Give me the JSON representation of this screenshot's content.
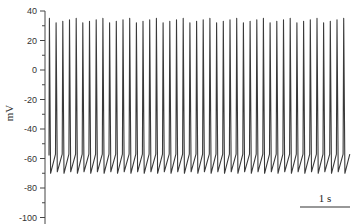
{
  "chart_data": {
    "type": "line",
    "title": "",
    "xlabel": "",
    "ylabel": "mV",
    "ylim": [
      -100,
      40
    ],
    "yticks": [
      40,
      20,
      0,
      -20,
      -40,
      -60,
      -80,
      -100
    ],
    "ytick_labels": [
      "40",
      "20",
      "0",
      "-20",
      "-40",
      "-60",
      "-80",
      "-100"
    ],
    "minor_yticks": true,
    "grid": false,
    "legend": null,
    "series": [
      {
        "name": "membrane potential",
        "description": "Tonic repetitive action-potential firing",
        "spike_count": 45,
        "spike_peak_mV": 35,
        "threshold_mV": -56,
        "afterhyperpolarization_trough_mV": -70,
        "firing_rate_hz": 7.5,
        "duration_s": 6,
        "color": "#333333"
      }
    ],
    "scale_bar": {
      "label": "1 s",
      "length_s": 1
    }
  },
  "axis": {
    "ylabel": "mV",
    "ticks": [
      "40",
      "20",
      "0",
      "-20",
      "-40",
      "-60",
      "-80",
      "-100"
    ]
  },
  "scale_bar": {
    "label": "1 s"
  }
}
